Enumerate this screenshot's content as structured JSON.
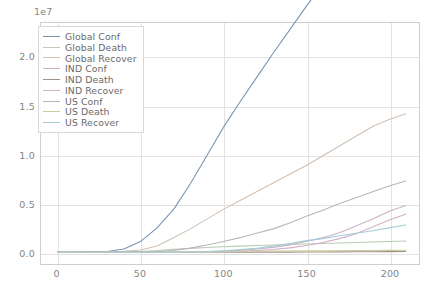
{
  "chart_data": {
    "type": "line",
    "title": "",
    "xlabel": "",
    "ylabel": "",
    "y_offset_text": "1e7",
    "y_offset_multiplier": 10000000,
    "xlim": [
      -10,
      218
    ],
    "ylim": [
      -1200000,
      23500000
    ],
    "grid": true,
    "legend_position": "upper left",
    "xticks": [
      0,
      50,
      100,
      150,
      200
    ],
    "xticklabels": [
      "0",
      "50",
      "100",
      "150",
      "200"
    ],
    "yticks": [
      0,
      5000000,
      10000000,
      15000000,
      20000000
    ],
    "yticklabels": [
      "0.0",
      "0.5",
      "1.0",
      "1.5",
      "2.0"
    ],
    "x": [
      0,
      10,
      20,
      30,
      40,
      50,
      60,
      70,
      80,
      90,
      100,
      110,
      120,
      130,
      140,
      150,
      160,
      170,
      180,
      190,
      200,
      210
    ],
    "series": [
      {
        "name": "Global Conf",
        "color": "#7d93b5",
        "values": [
          600,
          4500,
          75000,
          87000,
          340000,
          1100000,
          2500000,
          4400000,
          7000000,
          9900000,
          12800000,
          15400000,
          17900000,
          20400000,
          22800000,
          25200000,
          27500000,
          29900000,
          32300000,
          34800000,
          37300000,
          39900000
        ]
      },
      {
        "name": "Global Death",
        "color": "#b9cbb4",
        "values": [
          17,
          106,
          2200,
          3000,
          15000,
          66000,
          175000,
          300000,
          400000,
          490000,
          565000,
          630000,
          690000,
          750000,
          800000,
          850000,
          900000,
          950000,
          1000000,
          1050000,
          1100000,
          1150000
        ]
      },
      {
        "name": "Global Recover",
        "color": "#d2c1b2",
        "values": [
          30,
          270,
          18000,
          37000,
          100000,
          230000,
          640000,
          1500000,
          2400000,
          3400000,
          4400000,
          5300000,
          6200000,
          7100000,
          8000000,
          8900000,
          9900000,
          10900000,
          11900000,
          12900000,
          13600000,
          14200000
        ]
      },
      {
        "name": "IND Conf",
        "color": "#cdb1c6",
        "values": [
          0,
          0,
          3,
          3,
          28,
          500,
          2300,
          9200,
          31000,
          60000,
          115000,
          200000,
          330000,
          500000,
          760000,
          1100000,
          1500000,
          2000000,
          2700000,
          3400000,
          4200000,
          4800000
        ]
      },
      {
        "name": "IND Death",
        "color": "#a09186",
        "values": [
          0,
          0,
          0,
          0,
          0,
          9,
          56,
          300,
          1000,
          2000,
          3400,
          5600,
          9500,
          15000,
          21000,
          28000,
          35000,
          43000,
          52000,
          62000,
          71000,
          79000
        ]
      },
      {
        "name": "IND Recover",
        "color": "#d3aec6",
        "values": [
          0,
          0,
          0,
          0,
          3,
          40,
          160,
          1000,
          7700,
          18000,
          39000,
          96000,
          170000,
          280000,
          450000,
          690000,
          1000000,
          1400000,
          1900000,
          2600000,
          3300000,
          3900000
        ]
      },
      {
        "name": "US Conf",
        "color": "#b7b7b7",
        "values": [
          1,
          5,
          11,
          15,
          68,
          2700,
          53000,
          190000,
          430000,
          740000,
          1100000,
          1500000,
          1950000,
          2400000,
          3000000,
          3700000,
          4300000,
          5000000,
          5600000,
          6200000,
          6800000,
          7300000
        ]
      },
      {
        "name": "US Death",
        "color": "#c9cb9c",
        "values": [
          0,
          0,
          0,
          0,
          0,
          60,
          700,
          4000,
          15000,
          36000,
          62000,
          83000,
          100000,
          120000,
          132000,
          142000,
          150000,
          158000,
          168000,
          180000,
          192000,
          205000
        ]
      },
      {
        "name": "US Recover",
        "color": "#a4cdd8",
        "values": [
          0,
          0,
          0,
          0,
          7,
          60,
          350,
          7000,
          24000,
          64000,
          150000,
          270000,
          400000,
          630000,
          900000,
          1200000,
          1400000,
          1700000,
          1950000,
          2200000,
          2500000,
          2800000
        ]
      }
    ]
  }
}
